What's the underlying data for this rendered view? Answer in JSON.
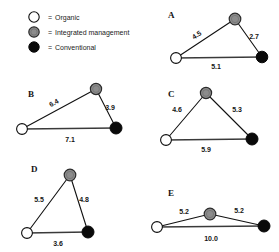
{
  "figure": {
    "width": 279,
    "height": 252,
    "background": "#ffffff"
  },
  "legend": {
    "equals": "=",
    "items": [
      {
        "key": "organic",
        "label": "Organic",
        "marker": "hollow-circle",
        "color": "#ffffff",
        "stroke": "#0d0d0d",
        "cx": 34,
        "cy": 17,
        "r": 5.2
      },
      {
        "key": "integrated",
        "label": "Integrated management",
        "marker": "gray-circle",
        "color": "#8c8c8c",
        "stroke": "#2b2b2b",
        "cx": 34,
        "cy": 32,
        "r": 5.2
      },
      {
        "key": "conventional",
        "label": "Conventional",
        "marker": "black-circle",
        "color": "#0a0a0a",
        "stroke": "#0a0a0a",
        "cx": 34,
        "cy": 47,
        "r": 5.2
      }
    ],
    "eq_x": 48,
    "label_x": 55
  },
  "chart_data": {
    "type": "diagram",
    "title": "",
    "node_types": [
      "Organic",
      "Integrated management",
      "Conventional"
    ],
    "panels": [
      {
        "letter": "A",
        "letter_x": 168,
        "letter_y": 18,
        "nodes": {
          "organic": {
            "x": 176,
            "y": 58,
            "r": 5.4
          },
          "integrated": {
            "x": 235,
            "y": 19,
            "r": 5.8
          },
          "conventional": {
            "x": 262,
            "y": 57,
            "r": 5.8
          }
        },
        "edges": [
          {
            "from": "organic",
            "to": "integrated",
            "value": "4.5",
            "lx": 198,
            "ly": 37,
            "rot": -33
          },
          {
            "from": "integrated",
            "to": "conventional",
            "value": "2.7",
            "lx": 254,
            "ly": 39,
            "rot": 0
          },
          {
            "from": "organic",
            "to": "conventional",
            "value": "5.1",
            "lx": 216,
            "ly": 69,
            "rot": 0,
            "base": true
          }
        ]
      },
      {
        "letter": "B",
        "letter_x": 28,
        "letter_y": 97,
        "nodes": {
          "organic": {
            "x": 22,
            "y": 129,
            "r": 5.4
          },
          "integrated": {
            "x": 96,
            "y": 89,
            "r": 5.6
          },
          "conventional": {
            "x": 116,
            "y": 128,
            "r": 6.0
          }
        },
        "edges": [
          {
            "from": "organic",
            "to": "integrated",
            "value": "6.4",
            "lx": 55,
            "ly": 105,
            "rot": -28
          },
          {
            "from": "integrated",
            "to": "conventional",
            "value": "3.9",
            "lx": 110,
            "ly": 110,
            "rot": 0
          },
          {
            "from": "organic",
            "to": "conventional",
            "value": "7.1",
            "lx": 70,
            "ly": 142,
            "rot": 0,
            "base": true
          }
        ]
      },
      {
        "letter": "C",
        "letter_x": 168,
        "letter_y": 97,
        "nodes": {
          "organic": {
            "x": 166,
            "y": 140,
            "r": 5.4
          },
          "integrated": {
            "x": 206,
            "y": 93,
            "r": 5.6
          },
          "conventional": {
            "x": 252,
            "y": 139,
            "r": 6.0
          }
        },
        "edges": [
          {
            "from": "organic",
            "to": "integrated",
            "value": "4.6",
            "lx": 177,
            "ly": 112,
            "rot": 0
          },
          {
            "from": "integrated",
            "to": "conventional",
            "value": "5.3",
            "lx": 237,
            "ly": 112,
            "rot": 0
          },
          {
            "from": "organic",
            "to": "conventional",
            "value": "5.9",
            "lx": 206,
            "ly": 152,
            "rot": 0,
            "base": true
          }
        ]
      },
      {
        "letter": "D",
        "letter_x": 31,
        "letter_y": 172,
        "nodes": {
          "organic": {
            "x": 27,
            "y": 233,
            "r": 5.4
          },
          "integrated": {
            "x": 70,
            "y": 175,
            "r": 5.8
          },
          "conventional": {
            "x": 88,
            "y": 232,
            "r": 6.0
          }
        },
        "edges": [
          {
            "from": "organic",
            "to": "integrated",
            "value": "5.5",
            "lx": 39,
            "ly": 202,
            "rot": 0
          },
          {
            "from": "integrated",
            "to": "conventional",
            "value": "4.8",
            "lx": 84,
            "ly": 202,
            "rot": 0
          },
          {
            "from": "organic",
            "to": "conventional",
            "value": "3.6",
            "lx": 58,
            "ly": 246,
            "rot": 0,
            "base": true
          }
        ]
      },
      {
        "letter": "E",
        "letter_x": 168,
        "letter_y": 196,
        "nodes": {
          "organic": {
            "x": 157,
            "y": 227,
            "r": 5.4
          },
          "integrated": {
            "x": 210,
            "y": 214,
            "r": 5.8
          },
          "conventional": {
            "x": 264,
            "y": 226,
            "r": 6.0
          }
        },
        "edges": [
          {
            "from": "organic",
            "to": "integrated",
            "value": "5.2",
            "lx": 184,
            "ly": 214,
            "rot": 0
          },
          {
            "from": "integrated",
            "to": "conventional",
            "value": "5.2",
            "lx": 239,
            "ly": 213,
            "rot": 0
          },
          {
            "from": "organic",
            "to": "conventional",
            "value": "10.0",
            "lx": 211,
            "ly": 241,
            "rot": 0,
            "base": true
          }
        ]
      }
    ]
  }
}
